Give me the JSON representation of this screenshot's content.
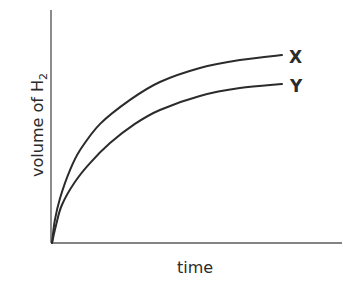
{
  "chart_data": {
    "type": "line",
    "title": "",
    "xlabel": "time",
    "ylabel": "volume of H",
    "ylabel_subscript": "2",
    "grid": false,
    "legend_position": "inline-right",
    "x_ticks": [],
    "y_ticks": [],
    "xlim": [
      0,
      1
    ],
    "ylim": [
      0,
      1
    ],
    "series": [
      {
        "name": "X",
        "x": [
          0,
          0.01,
          0.028,
          0.062,
          0.097,
          0.166,
          0.269,
          0.372,
          0.51,
          0.648,
          0.793
        ],
        "y": [
          0,
          0.099,
          0.193,
          0.313,
          0.399,
          0.511,
          0.614,
          0.691,
          0.751,
          0.785,
          0.807
        ]
      },
      {
        "name": "Y",
        "x": [
          0,
          0.014,
          0.034,
          0.079,
          0.131,
          0.2,
          0.286,
          0.372,
          0.51,
          0.648,
          0.793
        ],
        "y": [
          0,
          0.077,
          0.163,
          0.262,
          0.343,
          0.429,
          0.511,
          0.571,
          0.631,
          0.665,
          0.682
        ]
      }
    ]
  },
  "plot_box": {
    "left": 52,
    "right": 342,
    "top": 10,
    "bottom": 243
  }
}
